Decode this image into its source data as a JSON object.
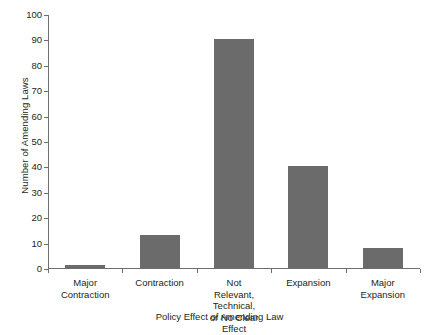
{
  "chart_data": {
    "type": "bar",
    "title": "",
    "xlabel": "Policy Effect of Amending Law",
    "ylabel": "Number of Amending Laws",
    "categories": [
      "Major\nContraction",
      "Contraction",
      "Not\nRelevant, Technical,\nor No Clear Effect",
      "Expansion",
      "Major\nExpansion"
    ],
    "values": [
      1,
      13,
      90,
      40,
      8
    ],
    "ylim": [
      0,
      100
    ],
    "ytick_labels": [
      "0",
      "10",
      "20",
      "30",
      "40",
      "50",
      "60",
      "70",
      "80",
      "90",
      "100"
    ],
    "ytick_values": [
      0,
      10,
      20,
      30,
      40,
      50,
      60,
      70,
      80,
      90,
      100
    ],
    "grid": false,
    "legend": false,
    "bar_color": "#6b6b6b",
    "axis_color": "#6d6e71",
    "background": "#ffffff"
  }
}
